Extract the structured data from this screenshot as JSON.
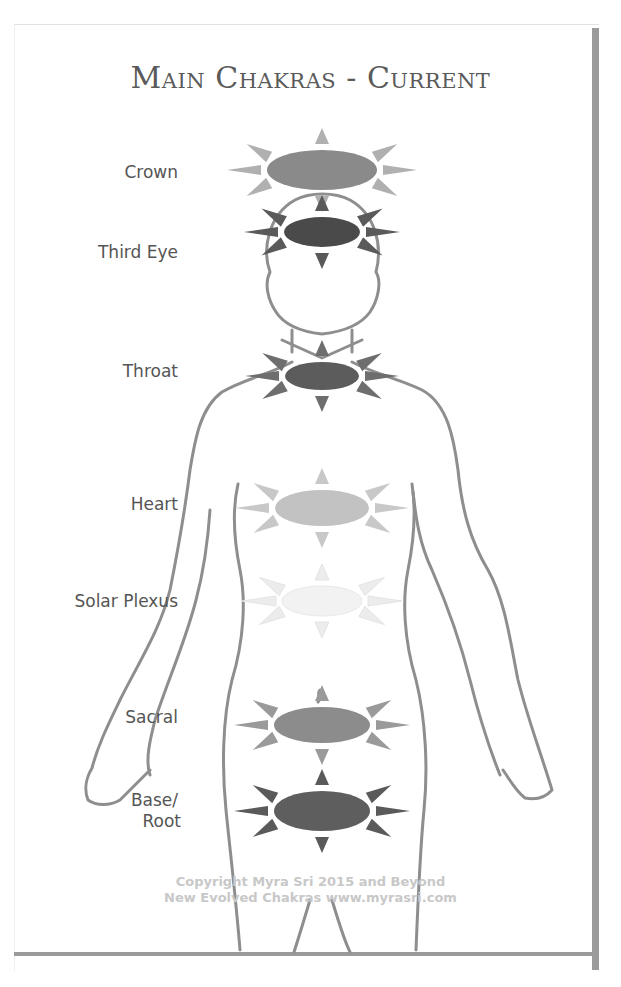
{
  "title": "Main Chakras - Current",
  "chakras": [
    {
      "name": "Crown",
      "label": "Crown",
      "cx": 322,
      "cy": 170,
      "rx": 55,
      "ry": 20,
      "color": "#8a8a8a",
      "ray_color": "#b0b0b0",
      "label_y": 162
    },
    {
      "name": "Third Eye",
      "label": "Third Eye",
      "cx": 322,
      "cy": 232,
      "rx": 38,
      "ry": 15,
      "color": "#4a4a4a",
      "ray_color": "#5a5a5a",
      "label_y": 242
    },
    {
      "name": "Throat",
      "label": "Throat",
      "cx": 322,
      "cy": 376,
      "rx": 37,
      "ry": 14,
      "color": "#5c5c5c",
      "ray_color": "#6e6e6e",
      "label_y": 361
    },
    {
      "name": "Heart",
      "label": "Heart",
      "cx": 322,
      "cy": 508,
      "rx": 47,
      "ry": 18,
      "color": "#c2c2c2",
      "ray_color": "#c8c8c8",
      "label_y": 494
    },
    {
      "name": "Solar Plexus",
      "label": "Solar Plexus",
      "cx": 322,
      "cy": 601,
      "rx": 40,
      "ry": 15,
      "color": "#f2f2f2",
      "ray_color": "#ececec",
      "label_y": 591
    },
    {
      "name": "Sacral",
      "label": "Sacral",
      "cx": 322,
      "cy": 725,
      "rx": 48,
      "ry": 18,
      "color": "#8c8c8c",
      "ray_color": "#9a9a9a",
      "label_y": 707
    },
    {
      "name": "Base/Root",
      "label_line1": "Base/",
      "label_line2": "Root",
      "cx": 322,
      "cy": 811,
      "rx": 48,
      "ry": 20,
      "color": "#5e5e5e",
      "ray_color": "#5a5a5a",
      "label_y": 790
    }
  ],
  "copyright": {
    "line1": "Copyright Myra Sri 2015 and Beyond",
    "line2": "New Evolved Chakras  www.myrasri.com"
  }
}
